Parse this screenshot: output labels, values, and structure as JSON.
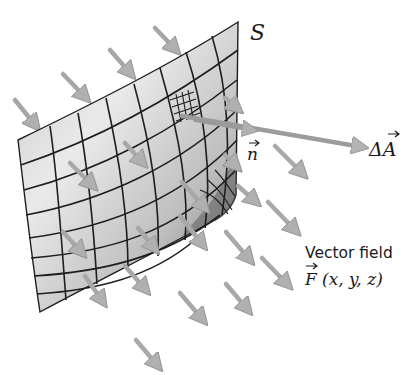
{
  "figure": {
    "type": "flux-surface-diagram",
    "surface_label": "S",
    "area_vector_label": "ΔA",
    "normal_label": "n",
    "vector_field_caption": "Vector field",
    "vector_field_formula": "F (x, y, z)",
    "vector_field_symbol": "F",
    "vector_field_args": "(x, y, z)"
  },
  "colors": {
    "surface_light": "#e4e4e4",
    "surface_dark": "#7a7a7a",
    "grid_lines": "#1e1e1e",
    "arrow": "#a8a8a8",
    "arrow_head": "#b4b4b4",
    "text": "#1a1a1a",
    "background": "#ffffff"
  },
  "field_arrows": [
    {
      "x1": 155,
      "y1": 28,
      "x2": 178,
      "y2": 52
    },
    {
      "x1": 110,
      "y1": 50,
      "x2": 133,
      "y2": 76
    },
    {
      "x1": 63,
      "y1": 74,
      "x2": 88,
      "y2": 100
    },
    {
      "x1": 15,
      "y1": 100,
      "x2": 38,
      "y2": 128
    },
    {
      "x1": 125,
      "y1": 143,
      "x2": 145,
      "y2": 165
    },
    {
      "x1": 70,
      "y1": 163,
      "x2": 95,
      "y2": 188
    },
    {
      "x1": 172,
      "y1": 112,
      "x2": 190,
      "y2": 128
    },
    {
      "x1": 225,
      "y1": 98,
      "x2": 240,
      "y2": 110
    },
    {
      "x1": 225,
      "y1": 155,
      "x2": 238,
      "y2": 168
    },
    {
      "x1": 275,
      "y1": 145,
      "x2": 305,
      "y2": 176
    },
    {
      "x1": 240,
      "y1": 185,
      "x2": 258,
      "y2": 203
    },
    {
      "x1": 268,
      "y1": 200,
      "x2": 298,
      "y2": 233
    },
    {
      "x1": 225,
      "y1": 230,
      "x2": 252,
      "y2": 262
    },
    {
      "x1": 262,
      "y1": 256,
      "x2": 290,
      "y2": 287
    },
    {
      "x1": 180,
      "y1": 180,
      "x2": 207,
      "y2": 210
    },
    {
      "x1": 178,
      "y1": 215,
      "x2": 205,
      "y2": 247
    },
    {
      "x1": 137,
      "y1": 227,
      "x2": 157,
      "y2": 251
    },
    {
      "x1": 226,
      "y1": 283,
      "x2": 250,
      "y2": 312
    },
    {
      "x1": 180,
      "y1": 292,
      "x2": 205,
      "y2": 322
    },
    {
      "x1": 137,
      "y1": 340,
      "x2": 160,
      "y2": 368
    },
    {
      "x1": 85,
      "y1": 275,
      "x2": 105,
      "y2": 305
    },
    {
      "x1": 125,
      "y1": 265,
      "x2": 148,
      "y2": 292
    },
    {
      "x1": 65,
      "y1": 230,
      "x2": 85,
      "y2": 253
    }
  ]
}
